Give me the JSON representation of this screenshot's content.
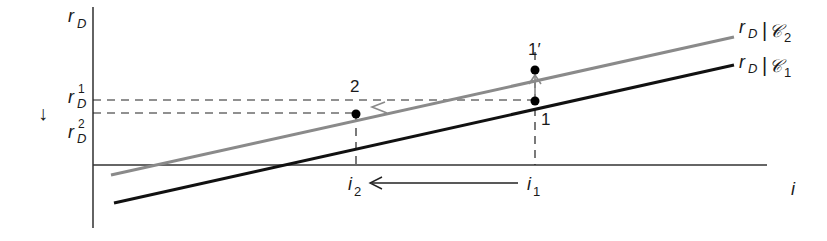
{
  "diagram": {
    "y_axis_label": {
      "main": "r",
      "sub": "D"
    },
    "x_axis_label": "i",
    "y_ticks": [
      {
        "main": "r",
        "sub": "D",
        "sup": "1"
      },
      {
        "main": "r",
        "sub": "D",
        "sup": "2"
      }
    ],
    "x_ticks": [
      {
        "main": "i",
        "sub": "2"
      },
      {
        "main": "i",
        "sub": "1"
      }
    ],
    "down_arrow_glyph": "↓",
    "curves": [
      {
        "name": "rD-given-C2",
        "main": "r",
        "sub": "D",
        "bar": "|",
        "script": "𝒞",
        "script_sub": "2",
        "color": "#8a8a8a"
      },
      {
        "name": "rD-given-C1",
        "main": "r",
        "sub": "D",
        "bar": "|",
        "script": "𝒞",
        "script_sub": "1",
        "color": "#111111"
      }
    ],
    "points": [
      {
        "label": "1′"
      },
      {
        "label": "1"
      },
      {
        "label": "2"
      }
    ]
  }
}
